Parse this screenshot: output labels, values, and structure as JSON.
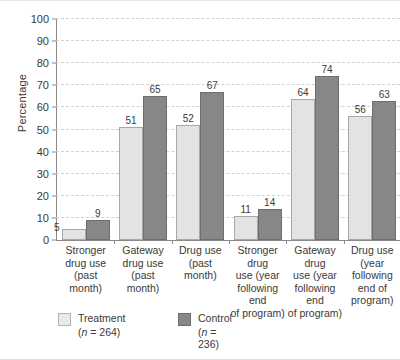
{
  "chart_data": {
    "type": "bar",
    "title": "",
    "xlabel": "",
    "ylabel": "Percentage",
    "ylim": [
      0,
      100
    ],
    "ytick_step": 10,
    "yticks": [
      0,
      10,
      20,
      30,
      40,
      50,
      60,
      70,
      80,
      90,
      100
    ],
    "grid": true,
    "legend_position": "bottom-left",
    "categories": [
      "Stronger drug use (past month)",
      "Gateway drug use (past month)",
      "Drug use (past month)",
      "Stronger drug use (year following end of program)",
      "Gateway drug use (year following end of program)",
      "Drug use (year following end of program)"
    ],
    "category_lines": [
      [
        "Stronger",
        "drug use",
        "(past month)"
      ],
      [
        "Gateway",
        "drug use",
        "(past month)"
      ],
      [
        "Drug use",
        "(past month)"
      ],
      [
        "Stronger drug",
        "use (year",
        "following end",
        "of program)"
      ],
      [
        "Gateway drug",
        "use (year",
        "following end",
        "of program)"
      ],
      [
        "Drug use",
        "(year following",
        "end of",
        "program)"
      ]
    ],
    "series": [
      {
        "name": "Treatment",
        "n_label": "(n = 264)",
        "color": "#e3e3e3",
        "values": [
          5,
          51,
          52,
          11,
          64,
          56
        ]
      },
      {
        "name": "Control",
        "n_label": "(n = 236)",
        "color": "#878787",
        "values": [
          9,
          65,
          67,
          14,
          74,
          63
        ]
      }
    ]
  },
  "legend": [
    {
      "label": "Treatment",
      "n": "(n = 264)",
      "n_prefix": "(",
      "n_var": "n",
      "n_suffix": " = 264)"
    },
    {
      "label": "Control",
      "n": "(n = 236)",
      "n_prefix": "(",
      "n_var": "n",
      "n_suffix": " = 236)"
    }
  ],
  "colors": {
    "treatment": "#e3e3e3",
    "control": "#878787",
    "axis": "#8a8a8a",
    "grid": "#d2d2d2",
    "text": "#3a3a3a"
  }
}
